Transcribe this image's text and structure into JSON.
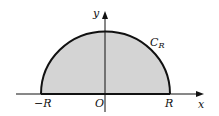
{
  "diagram": {
    "type": "semicircular contour",
    "region_fill": "#d4d4d4",
    "stroke_color": "#111111",
    "labels": {
      "y_axis": "y",
      "x_axis": "x",
      "curve": "C",
      "curve_sub": "R",
      "neg_r": "−R",
      "origin": "O",
      "pos_r": "R"
    }
  }
}
